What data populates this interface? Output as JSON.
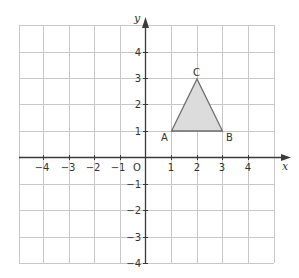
{
  "diagram": {
    "type": "coordinate-grid",
    "axes": {
      "x_label": "x",
      "y_label": "y",
      "origin_label": "O",
      "x_ticks": [
        "−4",
        "−3",
        "−2",
        "−1",
        "1",
        "2",
        "3",
        "4"
      ],
      "y_ticks": [
        "4",
        "3",
        "2",
        "1",
        "−1",
        "−2",
        "−3",
        "−4"
      ],
      "x_range": [
        -5,
        5
      ],
      "y_range": [
        -4,
        5
      ]
    },
    "triangle": {
      "vertices": [
        {
          "label": "A",
          "x": 1,
          "y": 1
        },
        {
          "label": "B",
          "x": 3,
          "y": 1
        },
        {
          "label": "C",
          "x": 2,
          "y": 3
        }
      ],
      "fill": "#dcdcdc",
      "stroke": "#6e6e6e"
    },
    "colors": {
      "grid": "#c8c8c8",
      "axis": "#3a3a3a",
      "text": "#333333"
    }
  }
}
